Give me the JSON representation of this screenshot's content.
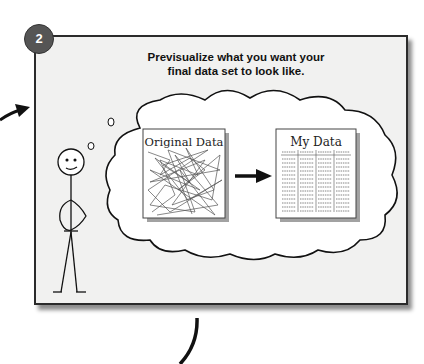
{
  "step": {
    "number": "2",
    "badge_color": "#555555"
  },
  "instruction": {
    "line1": "Previsualize what you want your",
    "line2": "final data set to look like."
  },
  "thought_bubble": {
    "left_document": {
      "label": "Original Data",
      "content": "tangled-lines"
    },
    "right_document": {
      "label": "My Data",
      "content": "table-columns",
      "columns": 4
    },
    "transform_arrow": "right-arrow"
  },
  "figure": "stick-figure-thinking",
  "connectors": {
    "incoming": "arrow-from-left",
    "outgoing": "curved-line-down"
  },
  "colors": {
    "panel_bg": "#f1f1f0",
    "border": "#2b2b2b",
    "ink": "#111111"
  }
}
